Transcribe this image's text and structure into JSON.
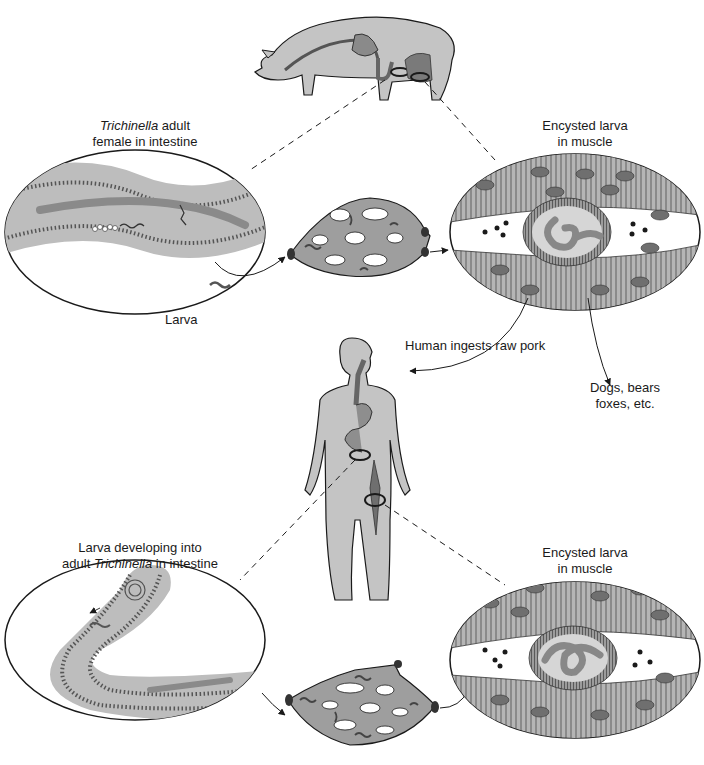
{
  "diagram": {
    "colors": {
      "tissue_fill": "#bdbdbd",
      "tissue_dark": "#8e8e8e",
      "worm": "#7d7d7d",
      "outline": "#1a1a1a",
      "background": "#ffffff",
      "muscle_stripe": "#9a9a9a",
      "nucleus": "#6f6f6f"
    },
    "labels": {
      "adult_female": {
        "italic": "Trichinella",
        "rest": " adult",
        "line2": "female in intestine"
      },
      "encysted_top": {
        "line1": "Encysted larva",
        "line2": "in muscle"
      },
      "larva": "Larva",
      "human_ingests": "Human ingests raw pork",
      "other_hosts": {
        "line1": "Dogs, bears",
        "line2": "foxes, etc."
      },
      "larva_developing": {
        "line1": "Larva developing into",
        "pre": "adult ",
        "italic": "Trichinella",
        "post": " in intestine"
      },
      "encysted_bottom": {
        "line1": "Encysted larva",
        "line2": "in muscle"
      }
    },
    "nodes": [
      {
        "id": "pig",
        "name": "Pig host"
      },
      {
        "id": "adult-intestine-pig",
        "name": "Adult female in intestine (pig)"
      },
      {
        "id": "capillary-top",
        "name": "Capillary bed (pig)"
      },
      {
        "id": "cyst-top",
        "name": "Encysted larva in muscle (pig)"
      },
      {
        "id": "human",
        "name": "Human host"
      },
      {
        "id": "intestine-human",
        "name": "Larva developing in intestine (human)"
      },
      {
        "id": "capillary-bottom",
        "name": "Capillary bed (human)"
      },
      {
        "id": "cyst-bottom",
        "name": "Encysted larva in muscle (human)"
      },
      {
        "id": "other-hosts",
        "name": "Dogs, bears, foxes, etc."
      }
    ],
    "edges": [
      {
        "from": "pig",
        "to": "adult-intestine-pig",
        "style": "dashed"
      },
      {
        "from": "pig",
        "to": "cyst-top",
        "style": "dashed"
      },
      {
        "from": "adult-intestine-pig",
        "to": "capillary-top",
        "style": "arrow"
      },
      {
        "from": "capillary-top",
        "to": "cyst-top",
        "style": "arrow"
      },
      {
        "from": "cyst-top",
        "to": "human",
        "style": "arrow",
        "label": "Human ingests raw pork"
      },
      {
        "from": "cyst-top",
        "to": "other-hosts",
        "style": "arrow"
      },
      {
        "from": "human",
        "to": "intestine-human",
        "style": "dashed"
      },
      {
        "from": "human",
        "to": "cyst-bottom",
        "style": "dashed"
      },
      {
        "from": "intestine-human",
        "to": "capillary-bottom",
        "style": "arrow"
      },
      {
        "from": "capillary-bottom",
        "to": "cyst-bottom",
        "style": "arrow"
      }
    ]
  }
}
